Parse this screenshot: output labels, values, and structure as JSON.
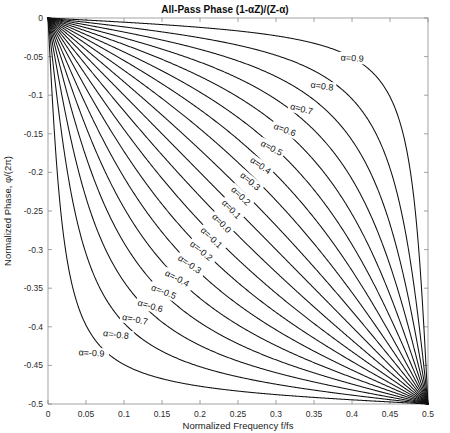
{
  "figure": {
    "title": "All-Pass Phase (1-αZ)/(Z-α)",
    "background": "#ffffff",
    "curve_color": "#111111",
    "axis_color": "#8c8c8c"
  },
  "chart_data": {
    "type": "line",
    "title": "All-Pass Phase (1-αZ)/(Z-α)",
    "xlabel": "Normalized Frequency f/fs",
    "ylabel": "Normalized Phase, φ/(2π)",
    "xlim": [
      0,
      0.5
    ],
    "ylim": [
      -0.5,
      0
    ],
    "grid": false,
    "legend": "inline-curve-labels",
    "xticks": [
      0,
      0.05,
      0.1,
      0.15,
      0.2,
      0.25,
      0.3,
      0.35,
      0.4,
      0.45,
      0.5
    ],
    "xticklabels": [
      "0",
      "0.05",
      "0.1",
      "0.15",
      "0.2",
      "0.25",
      "0.3",
      "0.35",
      "0.4",
      "0.45",
      "0.5"
    ],
    "yticks": [
      0,
      -0.05,
      -0.1,
      -0.15,
      -0.2,
      -0.25,
      -0.3,
      -0.35,
      -0.4,
      -0.45,
      -0.5
    ],
    "yticklabels": [
      "0",
      "-0.05",
      "-0.1",
      "-0.15",
      "-0.2",
      "-0.25",
      "-0.3",
      "-0.35",
      "-0.4",
      "-0.45",
      "-0.5"
    ],
    "alpha_values": [
      0.9,
      0.8,
      0.7,
      0.6,
      0.5,
      0.4,
      0.3,
      0.2,
      0.1,
      0.0,
      -0.1,
      -0.2,
      -0.3,
      -0.4,
      -0.5,
      -0.6,
      -0.7,
      -0.8,
      -0.9
    ],
    "series": [
      {
        "name": "α=0.9",
        "alpha": 0.9,
        "label": "α=0.9",
        "label_x": 0.385,
        "label_y": -0.055
      },
      {
        "name": "α=0.8",
        "alpha": 0.8,
        "label": "α=0.8",
        "label_x": 0.345,
        "label_y": -0.09
      },
      {
        "name": "α=0.7",
        "alpha": 0.7,
        "label": "α=0.7",
        "label_x": 0.318,
        "label_y": -0.118
      },
      {
        "name": "α=0.6",
        "alpha": 0.6,
        "label": "α=0.6",
        "label_x": 0.296,
        "label_y": -0.143
      },
      {
        "name": "α=0.5",
        "alpha": 0.5,
        "label": "α=0.5",
        "label_x": 0.279,
        "label_y": -0.165
      },
      {
        "name": "α=0.4",
        "alpha": 0.4,
        "label": "α=0.4",
        "label_x": 0.265,
        "label_y": -0.186
      },
      {
        "name": "α=0.3",
        "alpha": 0.3,
        "label": "α=0.3",
        "label_x": 0.252,
        "label_y": -0.205
      },
      {
        "name": "α=0.2",
        "alpha": 0.2,
        "label": "α=0.2",
        "label_x": 0.24,
        "label_y": -0.223
      },
      {
        "name": "α=0.1",
        "alpha": 0.1,
        "label": "α=0.1",
        "label_x": 0.228,
        "label_y": -0.24
      },
      {
        "name": "α=0.0",
        "alpha": 0.0,
        "label": "α=0.0",
        "label_x": 0.215,
        "label_y": -0.258
      },
      {
        "name": "α=-0.1",
        "alpha": -0.1,
        "label": "α=-0.1",
        "label_x": 0.2,
        "label_y": -0.276
      },
      {
        "name": "α=-0.2",
        "alpha": -0.2,
        "label": "α=-0.2",
        "label_x": 0.186,
        "label_y": -0.294
      },
      {
        "name": "α=-0.3",
        "alpha": -0.3,
        "label": "α=-0.3",
        "label_x": 0.17,
        "label_y": -0.313
      },
      {
        "name": "α=-0.4",
        "alpha": -0.4,
        "label": "α=-0.4",
        "label_x": 0.153,
        "label_y": -0.333
      },
      {
        "name": "α=-0.5",
        "alpha": -0.5,
        "label": "α=-0.5",
        "label_x": 0.135,
        "label_y": -0.352
      },
      {
        "name": "α=-0.6",
        "alpha": -0.6,
        "label": "α=-0.6",
        "label_x": 0.117,
        "label_y": -0.372
      },
      {
        "name": "α=-0.7",
        "alpha": -0.7,
        "label": "α=-0.7",
        "label_x": 0.097,
        "label_y": -0.391
      },
      {
        "name": "α=-0.8",
        "alpha": -0.8,
        "label": "α=-0.8",
        "label_x": 0.072,
        "label_y": -0.412
      },
      {
        "name": "α=-0.9",
        "alpha": -0.9,
        "label": "α=-0.9",
        "label_x": 0.04,
        "label_y": -0.437
      }
    ]
  }
}
